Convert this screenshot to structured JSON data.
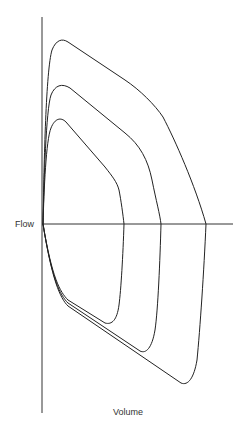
{
  "diagram": {
    "title": "",
    "axes": {
      "y_label": "Flow",
      "x_label": "Volume"
    },
    "loops": [
      {
        "name": "outer-loop",
        "peak_flow_point": [
          63,
          41
        ],
        "crossing_x": 206,
        "min_point": [
          181,
          383
        ]
      },
      {
        "name": "middle-loop",
        "peak_flow_point": [
          60,
          85
        ],
        "crossing_x": 161,
        "min_point": [
          140,
          351
        ]
      },
      {
        "name": "inner-loop",
        "peak_flow_point": [
          60,
          120
        ],
        "crossing_x": 124,
        "min_point": [
          105,
          323
        ]
      }
    ],
    "line_color": "#222222"
  }
}
